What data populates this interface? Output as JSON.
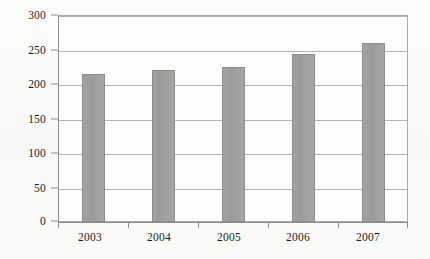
{
  "chart_data": {
    "type": "bar",
    "title": "",
    "subtitle": "",
    "xlabel": "",
    "ylabel": "",
    "categories": [
      "2003",
      "2004",
      "2005",
      "2006",
      "2007"
    ],
    "values": [
      215,
      221,
      226,
      245,
      260
    ],
    "series": [
      {
        "name": "",
        "values": [
          215,
          221,
          226,
          245,
          260
        ]
      }
    ],
    "ylim": [
      0,
      300
    ],
    "y_ticks": [
      0,
      50,
      100,
      150,
      200,
      250,
      300
    ],
    "y_tick_labels": [
      "0",
      "50",
      "100",
      "150",
      "200",
      "250",
      "300"
    ],
    "grid": true,
    "grid_axis": "y",
    "legend": false,
    "legend_position": "none",
    "annotations": [],
    "colors": {
      "bar_fill": "#9e9e9e",
      "bar_border": "#8c8c8c",
      "gridline": "#b4b4b4",
      "axis": "#8e8e8e",
      "plot_background": "#fdfdfc",
      "figure_background": "#fbfbfa",
      "text": "#1c1c1c"
    }
  }
}
